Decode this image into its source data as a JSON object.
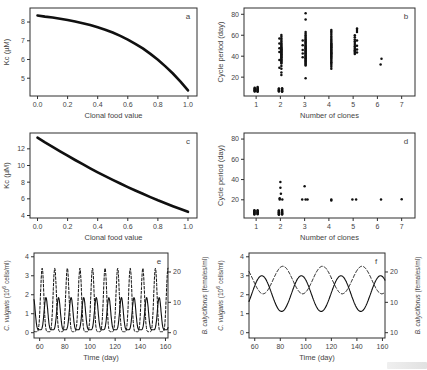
{
  "figure": {
    "background": "#ffffff",
    "frame_color": "#2e2e2e",
    "data_ink": "#101010",
    "text_color": "#444444"
  },
  "chart_data": [
    {
      "id": "a",
      "type": "line",
      "panel_label": "a",
      "xlabel": "Clonal food value",
      "ylabel": [
        {
          "t": "Kc (µM)"
        }
      ],
      "xlim": [
        -0.05,
        1.06
      ],
      "ylim": [
        4.05,
        8.75
      ],
      "xticks": [
        [
          0,
          "0.0"
        ],
        [
          0.2,
          "0.2"
        ],
        [
          0.4,
          "0.4"
        ],
        [
          0.6,
          "0.6"
        ],
        [
          0.8,
          "0.8"
        ],
        [
          1,
          "1.0"
        ]
      ],
      "yticks": [
        [
          5,
          "5"
        ],
        [
          6,
          "6"
        ],
        [
          7,
          "7"
        ],
        [
          8,
          "8"
        ]
      ],
      "series": [
        {
          "kind": "samples",
          "name": "Kc vs clonal food value",
          "width": 2.6,
          "x": [
            0,
            0.05,
            0.1,
            0.15,
            0.2,
            0.25,
            0.3,
            0.35,
            0.4,
            0.45,
            0.5,
            0.55,
            0.6,
            0.65,
            0.7,
            0.75,
            0.8,
            0.85,
            0.9,
            0.95,
            1.0
          ],
          "y": [
            8.35,
            8.29,
            8.24,
            8.18,
            8.11,
            8.03,
            7.94,
            7.84,
            7.72,
            7.59,
            7.44,
            7.26,
            7.06,
            6.84,
            6.59,
            6.3,
            5.99,
            5.63,
            5.25,
            4.82,
            4.35
          ]
        }
      ]
    },
    {
      "id": "b",
      "type": "scatter",
      "panel_label": "b",
      "xlabel": "Number of clones",
      "ylabel": [
        {
          "t": "Cycle period (day)"
        }
      ],
      "xlim": [
        0.5,
        7.55
      ],
      "ylim": [
        2,
        86
      ],
      "xticks": [
        [
          1,
          "1"
        ],
        [
          2,
          "2"
        ],
        [
          3,
          "3"
        ],
        [
          4,
          "4"
        ],
        [
          5,
          "5"
        ],
        [
          6,
          "6"
        ],
        [
          7,
          "7"
        ]
      ],
      "yticks": [
        [
          20,
          "20"
        ],
        [
          40,
          "40"
        ],
        [
          60,
          "60"
        ],
        [
          80,
          "80"
        ]
      ],
      "series": [
        {
          "kind": "cols",
          "name": "cycle periods",
          "size": 1.25,
          "cols": [
            {
              "x": 0.94,
              "ys": [
                6.2,
                6.8,
                7.4,
                8.0,
                8.6,
                9.2,
                9.8
              ]
            },
            {
              "x": 1.06,
              "ys": [
                6.0,
                6.6,
                7.2,
                7.8,
                8.4,
                9.0,
                9.7,
                10.5
              ]
            },
            {
              "x": 1.94,
              "ys": [
                6.2,
                6.8,
                7.4,
                8.0,
                8.6,
                9.2
              ]
            },
            {
              "x": 2.07,
              "ys": [
                6.0,
                6.6,
                7.2,
                7.9,
                8.6,
                9.4
              ]
            },
            {
              "x": 2.04,
              "ys": [
                22,
                24.5,
                28,
                30.5,
                33,
                34,
                35,
                35.8,
                36.6,
                37.4,
                38.2,
                39,
                39.7,
                40.4,
                41.1,
                41.8,
                42.5,
                43.2,
                43.9,
                44.6,
                45.3,
                46,
                46.7,
                47.4,
                48.1,
                48.9,
                49.7,
                50.6,
                51.6,
                52.7,
                54,
                55.4,
                57,
                58.6,
                60.3
              ]
            },
            {
              "x": 1.96,
              "ys": [
                29,
                36.5,
                44,
                47.5,
                52,
                57
              ]
            },
            {
              "x": 3.04,
              "ys": [
                19,
                31,
                32,
                33,
                34,
                34.8,
                35.6,
                36.4,
                37.2,
                38,
                38.8,
                39.6,
                40.4,
                41.2,
                42,
                42.8,
                43.6,
                44.4,
                45.2,
                46,
                46.8,
                47.6,
                48.4,
                49.2,
                50,
                51,
                52,
                53,
                54,
                55,
                56.2,
                57.4,
                58.6,
                60,
                61.5,
                63,
                75,
                81
              ]
            },
            {
              "x": 2.92,
              "ys": [
                39,
                42.5,
                46,
                50.5,
                55
              ]
            },
            {
              "x": 4.1,
              "ys": [
                28,
                30,
                31.5,
                33,
                34.3,
                35.5,
                36.6,
                37.7,
                38.7,
                39.6,
                40.5,
                41.3,
                42.1,
                42.9,
                43.7,
                44.5,
                45.3,
                46.1,
                46.9,
                47.7,
                48.6,
                49.5,
                50.4,
                51.4,
                52.4,
                53.5,
                54.7,
                56,
                57.4,
                58.9,
                60.5,
                62,
                63.5,
                65
              ]
            },
            {
              "x": 5.07,
              "ys": [
                42,
                43.2,
                44.4,
                45.6,
                46.8,
                48,
                49.5,
                51,
                52.5,
                54.2,
                56,
                58,
                60
              ]
            },
            {
              "x": 5.16,
              "ys": [
                43.5,
                46.5,
                50,
                55,
                63,
                65,
                66.5
              ]
            },
            {
              "x": 6.13,
              "ys": [
                32
              ]
            },
            {
              "x": 6.17,
              "ys": [
                37.5
              ]
            }
          ]
        }
      ]
    },
    {
      "id": "c",
      "type": "line",
      "panel_label": "c",
      "xlabel": "Clonal food value",
      "ylabel": [
        {
          "t": "Kc (µM)"
        }
      ],
      "xlim": [
        -0.05,
        1.06
      ],
      "ylim": [
        3.7,
        13.9
      ],
      "xticks": [
        [
          0,
          "0.0"
        ],
        [
          0.2,
          "0.2"
        ],
        [
          0.4,
          "0.4"
        ],
        [
          0.6,
          "0.6"
        ],
        [
          0.8,
          "0.8"
        ],
        [
          1,
          "1.0"
        ]
      ],
      "yticks": [
        [
          4,
          "4"
        ],
        [
          6,
          "6"
        ],
        [
          8,
          "8"
        ],
        [
          10,
          "10"
        ],
        [
          12,
          "12"
        ]
      ],
      "series": [
        {
          "kind": "samples",
          "name": "Kc vs clonal food value",
          "width": 2.6,
          "x": [
            0,
            0.05,
            0.1,
            0.15,
            0.2,
            0.25,
            0.3,
            0.35,
            0.4,
            0.45,
            0.5,
            0.55,
            0.6,
            0.65,
            0.7,
            0.75,
            0.8,
            0.85,
            0.9,
            0.95,
            1.0
          ],
          "y": [
            13.35,
            12.79,
            12.24,
            11.7,
            11.17,
            10.66,
            10.16,
            9.67,
            9.19,
            8.73,
            8.28,
            7.84,
            7.41,
            7.0,
            6.6,
            6.21,
            5.83,
            5.47,
            5.12,
            4.78,
            4.45
          ]
        }
      ]
    },
    {
      "id": "d",
      "type": "scatter",
      "panel_label": "d",
      "xlabel": "Number of clones",
      "ylabel": [
        {
          "t": "Cycle period (day)"
        }
      ],
      "xlim": [
        0.5,
        7.55
      ],
      "ylim": [
        2,
        86
      ],
      "xticks": [
        [
          1,
          "1"
        ],
        [
          2,
          "2"
        ],
        [
          3,
          "3"
        ],
        [
          4,
          "4"
        ],
        [
          5,
          "5"
        ],
        [
          6,
          "6"
        ],
        [
          7,
          "7"
        ]
      ],
      "yticks": [
        [
          20,
          "20"
        ],
        [
          40,
          "40"
        ],
        [
          60,
          "60"
        ],
        [
          80,
          "80"
        ]
      ],
      "series": [
        {
          "kind": "cols",
          "name": "cycle periods",
          "size": 1.25,
          "cols": [
            {
              "x": 0.93,
              "ys": [
                5.5,
                6.1,
                6.7,
                7.3,
                7.9,
                8.5,
                9.1,
                9.7
              ]
            },
            {
              "x": 1.06,
              "ys": [
                5.8,
                6.4,
                7.0,
                7.6,
                8.2,
                8.9,
                9.6
              ]
            },
            {
              "x": 1.94,
              "ys": [
                5.2,
                5.8,
                6.4,
                7.0,
                7.6,
                8.2,
                8.8,
                9.4
              ]
            },
            {
              "x": 2.07,
              "ys": [
                5.5,
                6.1,
                6.7,
                7.4,
                8.1,
                8.9,
                9.8
              ]
            },
            {
              "x": 1.97,
              "ys": [
                20.3,
                21.6
              ]
            },
            {
              "x": 2.08,
              "ys": [
                20.3
              ]
            },
            {
              "x": 2.02,
              "ys": [
                26.0
              ]
            },
            {
              "x": 2.0,
              "ys": [
                31.8,
                37.6
              ]
            },
            {
              "x": 2.9,
              "ys": [
                20.4
              ]
            },
            {
              "x": 3.04,
              "ys": [
                20.4
              ]
            },
            {
              "x": 3.12,
              "ys": [
                20.4
              ]
            },
            {
              "x": 3.0,
              "ys": [
                33.4
              ]
            },
            {
              "x": 4.1,
              "ys": [
                19.2,
                20.4
              ]
            },
            {
              "x": 4.97,
              "ys": [
                20.4
              ]
            },
            {
              "x": 5.12,
              "ys": [
                20.4
              ]
            },
            {
              "x": 6.15,
              "ys": [
                20.2
              ]
            },
            {
              "x": 7.0,
              "ys": [
                20.6
              ]
            }
          ]
        }
      ]
    },
    {
      "id": "e",
      "type": "dual-axis-line",
      "panel_label": "e",
      "xlabel": "Time (day)",
      "ylabel": [
        {
          "t": "C. vulgaris",
          "i": 1
        },
        {
          "t": " (10"
        },
        {
          "t": "6",
          "sup": 1
        },
        {
          "t": " cells/ml)"
        }
      ],
      "ylabel_right": [
        {
          "t": "B. calyciflorus",
          "i": 1
        },
        {
          "t": "  (females/ml)"
        }
      ],
      "xlim": [
        55.5,
        162
      ],
      "ylim": [
        -0.28,
        4.2
      ],
      "xticks": [
        [
          60,
          "60"
        ],
        [
          80,
          "80"
        ],
        [
          100,
          "100"
        ],
        [
          120,
          "120"
        ],
        [
          140,
          "140"
        ],
        [
          160,
          "160"
        ]
      ],
      "yticks": [
        [
          0,
          "0"
        ],
        [
          1,
          "1"
        ],
        [
          2,
          "2"
        ],
        [
          3,
          "3"
        ],
        [
          4,
          "4"
        ]
      ],
      "yticks_right": [
        [
          0,
          "0"
        ],
        [
          1.6,
          "10"
        ],
        [
          3.2,
          "20"
        ]
      ],
      "series": [
        {
          "kind": "wave",
          "name": "C. vulgaris (solid)",
          "width": 1.1,
          "min": 0.15,
          "max": 1.85,
          "period": 10,
          "peak_at": 65,
          "sharp": 2.5
        },
        {
          "kind": "wave",
          "name": "B. calyciflorus (dashed)",
          "width": 1.0,
          "dash": "2.6,1.8",
          "min": 0.05,
          "max": 3.4,
          "period": 10,
          "peak_at": 62,
          "sharp": 3
        }
      ]
    },
    {
      "id": "f",
      "type": "dual-axis-line",
      "panel_label": "f",
      "xlabel": "Time (day)",
      "ylabel": [
        {
          "t": "C. vulgaris",
          "i": 1
        },
        {
          "t": " (10"
        },
        {
          "t": "6",
          "sup": 1
        },
        {
          "t": " cells/ml)"
        }
      ],
      "ylabel_right": [
        {
          "t": "B. calyciflorus",
          "i": 1
        },
        {
          "t": "  (females/ml)"
        }
      ],
      "xlim": [
        55.5,
        162
      ],
      "ylim": [
        -0.28,
        4.2
      ],
      "xticks": [
        [
          60,
          "60"
        ],
        [
          80,
          "80"
        ],
        [
          100,
          "100"
        ],
        [
          120,
          "120"
        ],
        [
          140,
          "140"
        ],
        [
          160,
          "160"
        ]
      ],
      "yticks": [
        [
          0,
          "0"
        ],
        [
          1,
          "1"
        ],
        [
          2,
          "2"
        ],
        [
          3,
          "3"
        ],
        [
          4,
          "4"
        ]
      ],
      "yticks_right": [
        [
          0,
          "10"
        ],
        [
          1.6,
          "10"
        ],
        [
          3.2,
          "20"
        ]
      ],
      "series": [
        {
          "kind": "wave",
          "name": "C. vulgaris (solid)",
          "width": 1.1,
          "min": 1.12,
          "max": 3.0,
          "period": 31,
          "peak_at": 65.5,
          "sharp": 1
        },
        {
          "kind": "wave",
          "name": "B. calyciflorus (dashed)",
          "width": 1.0,
          "dash": "3.2,2.2",
          "min": 2.05,
          "max": 3.5,
          "period": 31,
          "peak_at": 82,
          "sharp": 1
        }
      ]
    }
  ]
}
